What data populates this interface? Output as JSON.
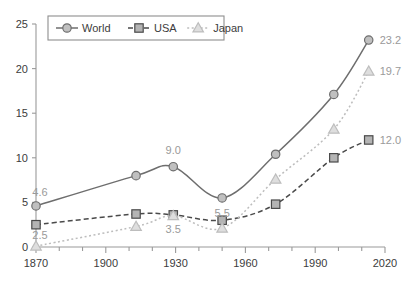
{
  "chart_data": {
    "type": "line",
    "title": "",
    "subtitle": "",
    "xlabel": "",
    "ylabel": "",
    "x": [
      1870,
      1913,
      1929,
      1950,
      1973,
      1998,
      2013
    ],
    "xlim": [
      1870,
      2020
    ],
    "ylim": [
      0,
      25
    ],
    "xticks": [
      1870,
      1900,
      1930,
      1960,
      1990,
      2020
    ],
    "xtick_labels": [
      "1870",
      "1900",
      "1930",
      "1960",
      "1990",
      "2020"
    ],
    "yticks": [
      0,
      5,
      10,
      15,
      20,
      25
    ],
    "ytick_labels": [
      "0",
      "5",
      "10",
      "15",
      "20",
      "25"
    ],
    "xminor_step": 10,
    "grid": false,
    "legend_position": "top-left",
    "series": [
      {
        "name": "World",
        "marker": "circle",
        "linestyle": "solid",
        "color": "#6e6e6e",
        "marker_fill": "#c0c0c0",
        "values": [
          4.6,
          8.0,
          9.0,
          5.5,
          10.4,
          17.1,
          23.2
        ],
        "point_labels": [
          {
            "x": 1870,
            "y": 4.6,
            "text": "4.6",
            "dx": 4,
            "dy": -10
          },
          {
            "x": 1929,
            "y": 9.0,
            "text": "9.0",
            "dx": 0,
            "dy": -13
          },
          {
            "x": 1950,
            "y": 5.5,
            "text": "5.5",
            "dx": 0,
            "dy": 19
          },
          {
            "x": 2013,
            "y": 23.2,
            "text": "23.2",
            "dx": 11,
            "dy": 4
          }
        ]
      },
      {
        "name": "USA",
        "marker": "square",
        "linestyle": "dashed",
        "color": "#4a4a4a",
        "marker_fill": "#b4b4b4",
        "values": [
          2.5,
          3.7,
          3.6,
          3.0,
          4.8,
          10.0,
          12.0
        ],
        "point_labels": [
          {
            "x": 1870,
            "y": 2.5,
            "text": "2.5",
            "dx": 4,
            "dy": 14
          },
          {
            "x": 2013,
            "y": 12.0,
            "text": "12.0",
            "dx": 11,
            "dy": 4
          }
        ]
      },
      {
        "name": "Japan",
        "marker": "triangle",
        "linestyle": "dotted",
        "color": "#bdbdbd",
        "marker_fill": "#dedede",
        "values": [
          0.1,
          2.3,
          3.5,
          2.1,
          7.6,
          13.2,
          19.7
        ],
        "point_labels": [
          {
            "x": 1929,
            "y": 3.5,
            "text": "3.5",
            "dx": 0,
            "dy": 17
          },
          {
            "x": 2013,
            "y": 19.7,
            "text": "19.7",
            "dx": 11,
            "dy": 4
          }
        ]
      }
    ]
  },
  "legend": {
    "items": [
      {
        "label": "World",
        "marker": "circle-marker-icon"
      },
      {
        "label": "USA",
        "marker": "square-marker-icon"
      },
      {
        "label": "Japan",
        "marker": "triangle-marker-icon"
      }
    ]
  },
  "colors": {
    "world": "#6e6e6e",
    "usa": "#4a4a4a",
    "japan": "#bdbdbd",
    "axis": "#9a9a9a",
    "tick_text": "#3c3c3c",
    "label_text": "#9a9a9a",
    "background": "#ffffff"
  }
}
